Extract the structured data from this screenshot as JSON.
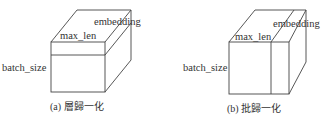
{
  "panels": [
    {
      "id": "a",
      "caption": "(a) 層歸一化",
      "labels": {
        "batch": "batch_size",
        "len": "max_len",
        "emb": "embedding"
      }
    },
    {
      "id": "b",
      "caption": "(b) 批歸一化",
      "labels": {
        "batch": "batch_size",
        "len": "max_len",
        "emb": "embedding"
      }
    }
  ]
}
